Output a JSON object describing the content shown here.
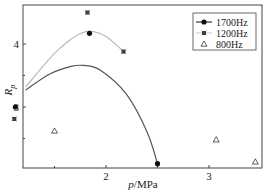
{
  "chart_data": {
    "type": "scatter",
    "title": "",
    "xlabel": "p/MPa",
    "ylabel": "R_p",
    "xlim": [
      0.9,
      3.5
    ],
    "ylim": [
      2.05,
      4.6
    ],
    "xticks": [
      {
        "value": 2,
        "label": "2"
      },
      {
        "value": 3,
        "label": "3"
      }
    ],
    "yticks": [
      {
        "value": 3,
        "label": "3"
      },
      {
        "value": 4,
        "label": "4"
      }
    ],
    "minor_xticks": [
      1.5,
      2.5
    ],
    "minor_yticks": [
      2.5,
      3.5
    ],
    "grid": false,
    "legend_position": "upper right",
    "series": [
      {
        "name": "1700Hz",
        "marker": "circle",
        "color": "#111111",
        "points": [
          [
            1.12,
            3.0
          ],
          [
            1.84,
            4.17
          ],
          [
            2.5,
            2.1
          ]
        ]
      },
      {
        "name": "1200Hz",
        "marker": "square",
        "color": "#333333",
        "points": [
          [
            1.11,
            2.81
          ],
          [
            1.82,
            4.5
          ],
          [
            2.17,
            3.88
          ]
        ]
      },
      {
        "name": "800Hz",
        "marker": "triangle-open",
        "color": "#333333",
        "points": [
          [
            1.5,
            2.62
          ],
          [
            3.07,
            2.48
          ],
          [
            3.45,
            2.13
          ]
        ]
      }
    ],
    "fit_curves": [
      {
        "name": "1200Hz-fit",
        "color": "#bbbbbb",
        "points": [
          [
            1.22,
            3.32
          ],
          [
            1.5,
            3.85
          ],
          [
            1.7,
            4.12
          ],
          [
            1.84,
            4.2
          ],
          [
            2.0,
            4.12
          ],
          [
            2.17,
            3.88
          ]
        ]
      },
      {
        "name": "1700Hz-fit",
        "color": "#555555",
        "points": [
          [
            1.22,
            3.27
          ],
          [
            1.45,
            3.52
          ],
          [
            1.65,
            3.64
          ],
          [
            1.78,
            3.66
          ],
          [
            1.95,
            3.58
          ],
          [
            2.2,
            3.2
          ],
          [
            2.4,
            2.6
          ],
          [
            2.5,
            2.1
          ]
        ]
      }
    ]
  }
}
